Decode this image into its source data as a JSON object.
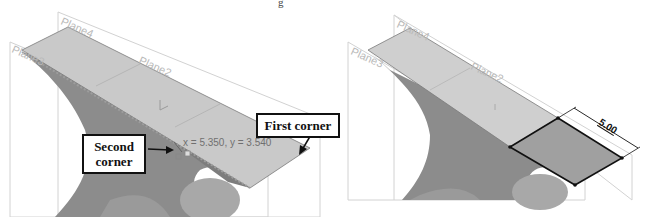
{
  "header_fragment": "g",
  "left_viewport": {
    "plane_labels": [
      "Plane4",
      "Plane3",
      "Plane2"
    ],
    "cursor_coordinates": "x = 5.350, y = 3.540",
    "callouts": {
      "first_corner": "First corner",
      "second_corner_line1": "Second",
      "second_corner_line2": "corner"
    }
  },
  "right_viewport": {
    "plane_labels": [
      "Plane4",
      "Plane3",
      "Plane2"
    ],
    "dimension_value": "5.00"
  },
  "colors": {
    "top_face": "#c8c8c8",
    "body_dark": "#8a8a8a",
    "body_mid": "#a6a6a6",
    "sketch_rect": "#9e9e9e",
    "plane_outline": "#cfcfcf",
    "callout_border": "#111111"
  }
}
